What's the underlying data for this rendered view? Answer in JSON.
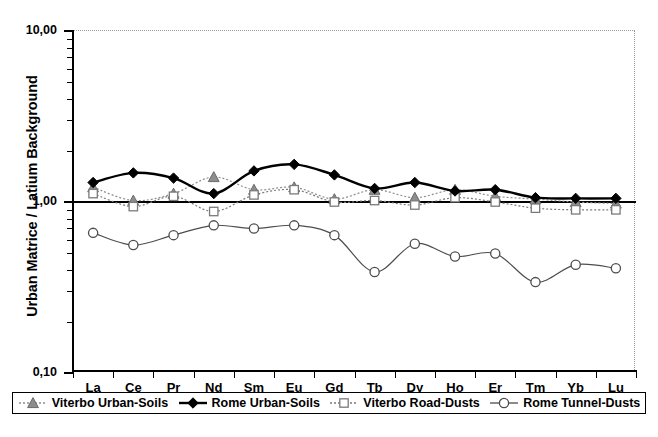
{
  "chart_data": {
    "type": "line",
    "title": "",
    "xlabel": "",
    "ylabel": "Urban Matrice / Latium Background",
    "log_y": true,
    "ylim": [
      0.1,
      10.0
    ],
    "y_ticks": [
      "10,00",
      "1,00",
      "0,10"
    ],
    "y_tick_values": [
      10.0,
      1.0,
      0.1
    ],
    "grid": false,
    "reference_line": 1.0,
    "legend_position": "bottom",
    "categories": [
      "La",
      "Ce",
      "Pr",
      "Nd",
      "Sm",
      "Eu",
      "Gd",
      "Tb",
      "Dy",
      "Ho",
      "Er",
      "Tm",
      "Yb",
      "Lu"
    ],
    "series": [
      {
        "name": "Viterbo Urban-Soils",
        "marker": "triangle",
        "color": "#8d8d8d",
        "line_style": "dotted",
        "values": [
          1.22,
          1.02,
          1.12,
          1.4,
          1.18,
          1.22,
          1.04,
          1.18,
          1.06,
          1.18,
          1.08,
          1.04,
          1.0,
          0.98
        ]
      },
      {
        "name": "Rome Urban-Soils",
        "marker": "diamond",
        "color": "#000000",
        "line_style": "solid",
        "values": [
          1.3,
          1.48,
          1.38,
          1.12,
          1.52,
          1.66,
          1.44,
          1.2,
          1.3,
          1.16,
          1.18,
          1.06,
          1.05,
          1.05
        ]
      },
      {
        "name": "Viterbo Road-Dusts",
        "marker": "square",
        "color": "#7a7a7a",
        "line_style": "dotted",
        "values": [
          1.12,
          0.94,
          1.08,
          0.88,
          1.1,
          1.18,
          1.0,
          1.02,
          0.96,
          1.06,
          1.0,
          0.92,
          0.9,
          0.9
        ]
      },
      {
        "name": "Rome Tunnel-Dusts",
        "marker": "circle",
        "color": "#4d4d4d",
        "line_style": "solid",
        "values": [
          0.66,
          0.56,
          0.64,
          0.73,
          0.7,
          0.73,
          0.64,
          0.39,
          0.57,
          0.48,
          0.5,
          0.34,
          0.43,
          0.41
        ]
      }
    ]
  }
}
